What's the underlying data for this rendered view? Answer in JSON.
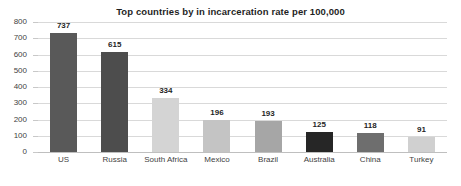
{
  "chart_data": {
    "type": "bar",
    "title": "Top countries by in incarceration rate per 100,000",
    "xlabel": "",
    "ylabel": "",
    "categories": [
      "US",
      "Russia",
      "South Africa",
      "Mexico",
      "Brazil",
      "Australia",
      "China",
      "Turkey"
    ],
    "values": [
      737,
      615,
      334,
      196,
      193,
      125,
      118,
      91
    ],
    "value_labels": [
      "737",
      "615",
      "334",
      "196",
      "193",
      "125",
      "118",
      "91"
    ],
    "bar_colors": [
      "#595959",
      "#4d4d4d",
      "#d4d4d4",
      "#c4c4c4",
      "#a6a6a6",
      "#262626",
      "#6e6e6e",
      "#d0d0d0"
    ],
    "ylim": [
      0,
      800
    ],
    "y_ticks": [
      0,
      100,
      200,
      300,
      400,
      500,
      600,
      700,
      800
    ],
    "y_tick_labels": [
      "0",
      "100",
      "200",
      "300",
      "400",
      "500",
      "600",
      "700",
      "800"
    ],
    "grid": true,
    "grid_color": "#d9d9d9",
    "axis_color": "#bfbfbf",
    "legend": null,
    "legend_position": "none",
    "background": "#ffffff",
    "data_labels_shown": true
  }
}
